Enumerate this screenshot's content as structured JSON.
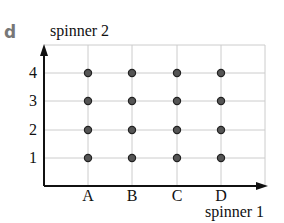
{
  "panel_label": "d",
  "chart_data": {
    "type": "scatter",
    "title": "",
    "xlabel": "spinner 1",
    "ylabel": "spinner 2",
    "x_categories": [
      "A",
      "B",
      "C",
      "D"
    ],
    "y_categories": [
      "1",
      "2",
      "3",
      "4"
    ],
    "points": [
      {
        "x": "A",
        "y": "1"
      },
      {
        "x": "A",
        "y": "2"
      },
      {
        "x": "A",
        "y": "3"
      },
      {
        "x": "A",
        "y": "4"
      },
      {
        "x": "B",
        "y": "1"
      },
      {
        "x": "B",
        "y": "2"
      },
      {
        "x": "B",
        "y": "3"
      },
      {
        "x": "B",
        "y": "4"
      },
      {
        "x": "C",
        "y": "1"
      },
      {
        "x": "C",
        "y": "2"
      },
      {
        "x": "C",
        "y": "3"
      },
      {
        "x": "C",
        "y": "4"
      },
      {
        "x": "D",
        "y": "1"
      },
      {
        "x": "D",
        "y": "2"
      },
      {
        "x": "D",
        "y": "3"
      },
      {
        "x": "D",
        "y": "4"
      }
    ],
    "grid": true,
    "legend": null,
    "colors": {
      "point_fill": "#555555",
      "point_stroke": "#222222",
      "grid": "#cccccc",
      "axis": "#111111"
    }
  }
}
